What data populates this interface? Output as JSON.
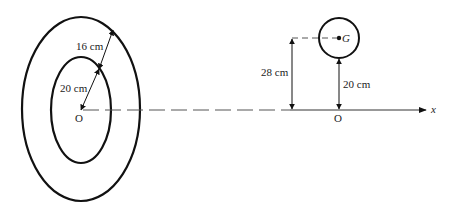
{
  "diagram": {
    "labels": {
      "outer_radius": "16 cm",
      "inner_radius": "20 cm",
      "origin_left": "O",
      "origin_right": "O",
      "height_G": "28 cm",
      "gap_to_circle": "20 cm",
      "centroid": "G",
      "x_axis": "x"
    },
    "colors": {
      "stroke": "#111111",
      "text": "#222222",
      "background": "#ffffff"
    }
  }
}
